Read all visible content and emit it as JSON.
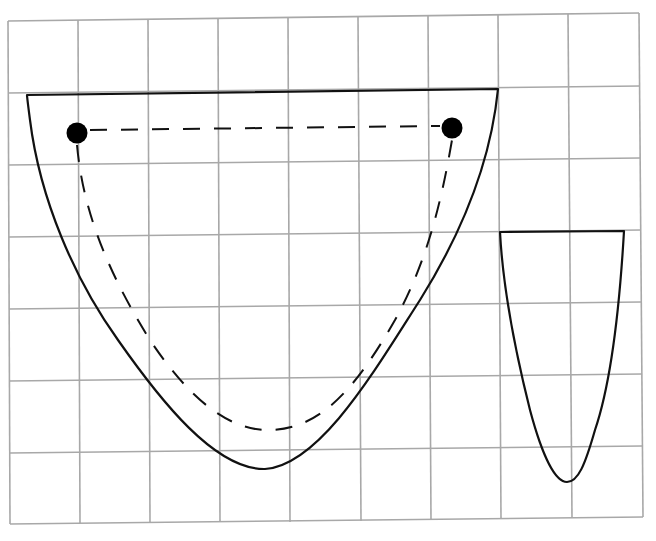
{
  "figure": {
    "background": "#ffffff",
    "grid": {
      "color": "#a8a8a8",
      "columns": 9,
      "rows": 7,
      "x_lines": [
        8,
        78,
        148,
        218,
        288,
        358,
        428,
        498,
        570,
        641
      ],
      "y_lines": [
        19,
        92,
        163,
        234,
        305,
        377,
        449,
        521
      ]
    },
    "large_shape": {
      "stroke": "#111111",
      "top_left": [
        27,
        94
      ],
      "top_right": [
        498,
        89
      ],
      "bottom": [
        265,
        469
      ]
    },
    "dashed_path": {
      "stroke": "#111111",
      "start_dot": [
        77,
        133
      ],
      "end_dot": [
        452,
        128
      ],
      "bottom": [
        275,
        430
      ]
    },
    "dots": [
      {
        "name": "left-point",
        "center": [
          77,
          133
        ],
        "radius": 10,
        "color": "#000000"
      },
      {
        "name": "right-point",
        "center": [
          452,
          128
        ],
        "radius": 10,
        "color": "#000000"
      }
    ],
    "small_shape": {
      "stroke": "#111111",
      "top_left": [
        500,
        232
      ],
      "top_right": [
        624,
        231
      ],
      "bottom": [
        567,
        482
      ]
    }
  }
}
